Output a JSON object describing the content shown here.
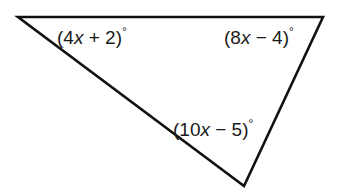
{
  "figure": {
    "type": "triangle",
    "stroke_color": "#111111",
    "background": "#ffffff",
    "vertices": {
      "top_left": [
        18,
        17
      ],
      "top_right": [
        323,
        17
      ],
      "bottom": [
        244,
        186
      ]
    },
    "angles": [
      {
        "position": "top-left",
        "open": "(",
        "coef": "4",
        "var": "x",
        "rest": " + 2)",
        "deg": "°",
        "expression": "(4x + 2)°"
      },
      {
        "position": "top-right",
        "open": "(",
        "coef": "8",
        "var": "x",
        "rest": " − 4)",
        "deg": "°",
        "expression": "(8x − 4)°"
      },
      {
        "position": "bottom",
        "open": "(",
        "coef": "10",
        "var": "x",
        "rest": " − 5)",
        "deg": "°",
        "expression": "(10x − 5)°"
      }
    ]
  }
}
